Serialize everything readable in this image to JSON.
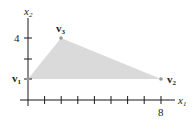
{
  "diagram": {
    "axes": {
      "x_label": "x",
      "x_sub": "1",
      "y_label": "x",
      "y_sub": "2",
      "x_tick_label": "8",
      "y_tick_label": "4"
    },
    "vertices": [
      {
        "name": "v",
        "sub": "1",
        "x": 0,
        "y": 1
      },
      {
        "name": "v",
        "sub": "2",
        "x": 8,
        "y": 1
      },
      {
        "name": "v",
        "sub": "3",
        "x": 2,
        "y": 4
      }
    ],
    "colors": {
      "fill": "#d9d9d9",
      "axis": "#1a1a1a",
      "point": "#999999"
    }
  }
}
